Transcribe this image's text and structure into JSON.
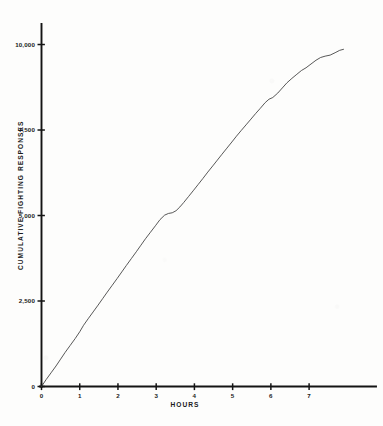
{
  "figure": {
    "background_color": "#fdfdfc",
    "ink_color": "#1b1b1b",
    "curve_color": "#3a3a3a"
  },
  "chart_data": {
    "type": "line",
    "title": "",
    "subtitle": "",
    "xlabel": "HOURS",
    "ylabel": "CUMULATIVE FIGHTING RESPONSES",
    "xlim": [
      0,
      8.75
    ],
    "ylim": [
      0,
      10600
    ],
    "grid": false,
    "legend": null,
    "xticks": [
      0,
      1,
      2,
      3,
      4,
      5,
      6,
      7
    ],
    "xticklabels": [
      "0",
      "1",
      "2",
      "3",
      "4",
      "5",
      "6",
      "7"
    ],
    "yticks": [
      0,
      2500,
      5000,
      7500,
      10000
    ],
    "yticklabels": [
      "0",
      "2,500",
      "5,000",
      "7,500",
      "10,000"
    ],
    "series": [
      {
        "name": "cumulative fighting responses",
        "x": [
          0.0,
          0.12,
          0.25,
          0.38,
          0.5,
          0.62,
          0.75,
          0.88,
          1.0,
          1.1,
          1.22,
          1.35,
          1.48,
          1.6,
          1.72,
          1.85,
          1.98,
          2.1,
          2.22,
          2.35,
          2.48,
          2.6,
          2.72,
          2.85,
          2.98,
          3.1,
          3.22,
          3.32,
          3.42,
          3.52,
          3.62,
          3.72,
          3.85,
          3.98,
          4.1,
          4.22,
          4.35,
          4.48,
          4.6,
          4.72,
          4.85,
          4.98,
          5.1,
          5.22,
          5.35,
          5.48,
          5.6,
          5.72,
          5.85,
          5.95,
          6.05,
          6.18,
          6.3,
          6.42,
          6.55,
          6.68,
          6.8,
          6.92,
          7.05,
          7.18,
          7.3,
          7.42,
          7.55,
          7.68,
          7.8,
          7.9
        ],
        "y": [
          0,
          200,
          400,
          600,
          800,
          1000,
          1200,
          1400,
          1600,
          1790,
          1980,
          2180,
          2380,
          2570,
          2760,
          2960,
          3160,
          3350,
          3540,
          3740,
          3940,
          4130,
          4320,
          4510,
          4700,
          4880,
          5010,
          5060,
          5080,
          5140,
          5250,
          5380,
          5560,
          5740,
          5910,
          6080,
          6270,
          6450,
          6620,
          6790,
          6970,
          7150,
          7320,
          7480,
          7650,
          7820,
          7980,
          8130,
          8300,
          8400,
          8450,
          8580,
          8730,
          8880,
          9010,
          9130,
          9240,
          9320,
          9430,
          9540,
          9620,
          9660,
          9690,
          9760,
          9830,
          9860
        ]
      }
    ],
    "annotations": []
  },
  "axes": {
    "x_axis_name": "hours-axis",
    "y_axis_name": "cumulative-responses-axis"
  }
}
